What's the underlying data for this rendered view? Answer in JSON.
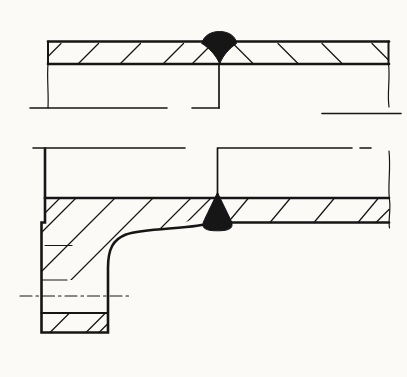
{
  "canvas": {
    "width": 407,
    "height": 377,
    "background": "#fbfaf7",
    "ink": "#161616"
  },
  "drawing": {
    "clips": [
      {
        "id": "clip-flange-hub",
        "d": "M45,198 L213,198 L213,201 C205,210 196,218.5 185,222.5 C165,229.5 141,230 126,234.5 C113,239.5 108,249 108,268 L108,280 L41.5,280 L41.5,222.5 L45,222.5 Z"
      }
    ],
    "groups": [
      {
        "name": "top-pipe-outer-surface-line",
        "stroke": 2.6,
        "paths": [
          "M48,41.5 L389,41.5"
        ]
      },
      {
        "name": "top-pipe-inner-surface-line",
        "stroke": 2.6,
        "paths": [
          "M48,64 L389,64"
        ]
      },
      {
        "name": "top-pipe-left-end-edge",
        "stroke": 2.0,
        "paths": [
          "M48,41.5 L48,64"
        ]
      },
      {
        "name": "top-pipe-left-break-edge",
        "stroke": 1.2,
        "paths": [
          "M48,64 C46.8,78 48.8,94 48,108"
        ]
      },
      {
        "name": "top-pipe-right-end-edge",
        "stroke": 2.0,
        "paths": [
          "M388.5,41.5 L388.5,64"
        ]
      },
      {
        "name": "top-pipe-right-break-edge",
        "stroke": 1.2,
        "paths": [
          "M388.5,64 C390.4,78 387,93 389,107"
        ]
      },
      {
        "name": "top-joint-root-line",
        "stroke": 1.7,
        "paths": [
          "M219,64 L219,108"
        ]
      },
      {
        "name": "top-pipe-bore-lines",
        "stroke": 1.6,
        "paths": [
          "M30,108 L167,108",
          "M192,108 L219,108",
          "M322,113.5 L401,113.5"
        ]
      },
      {
        "name": "top-pipe-hatching-left-part",
        "stroke": 1.25,
        "paths": [
          "M48,56.5 L61,43.5",
          "M78,64 L98.5,43.5",
          "M120,64 L140.5,43.5",
          "M163,64 L183.5,43.5",
          "M192,64 L212,44"
        ]
      },
      {
        "name": "top-pipe-hatching-right-part",
        "stroke": 1.25,
        "paths": [
          "M233,43.5 L253.5,64",
          "M278,43.5 L298.5,64",
          "M322,43.5 L342.5,64",
          "M372,43.5 L388.5,60"
        ]
      },
      {
        "name": "top-weld-bead",
        "stroke": 1.0,
        "fill": true,
        "paths": [
          "M202,43.5 C203,36.5 210,31.5 219.5,31.5 C229,31.5 236,36.5 236.5,43.5 C229.5,48.5 223,55 219.7,64 C216,55 209.5,48.5 202,43.5 Z"
        ]
      },
      {
        "name": "bottom-pipe-outer-surface-lines",
        "stroke": 1.6,
        "paths": [
          "M33,148 L185,148",
          "M218,148 L352,148",
          "M360,148 L371,148"
        ]
      },
      {
        "name": "flange-front-face-edge",
        "stroke": 2.6,
        "paths": [
          "M45,148.5 L45,198"
        ]
      },
      {
        "name": "bottom-joint-root-line",
        "stroke": 1.7,
        "paths": [
          "M217.5,148 L217.5,194"
        ]
      },
      {
        "name": "bottom-pipe-right-break-edge",
        "stroke": 1.2,
        "paths": [
          "M389,151 C391,170 387.5,185 389.5,200",
          "M389.5,200 C391,210 388,220 389.5,228"
        ]
      },
      {
        "name": "bottom-pipe-wall-top-line",
        "stroke": 2.6,
        "paths": [
          "M45,198 L389,198"
        ]
      },
      {
        "name": "bottom-pipe-wall-bottom-line",
        "stroke": 2.6,
        "paths": [
          "M214,222.5 L389,222.5"
        ]
      },
      {
        "name": "flange-outline",
        "stroke": 2.6,
        "paths": [
          "M45,198 L45,222.5 L41.5,222.5 L41.5,332.5 L108,332.5 L108,268 C108,249 113,239.5 126,234.5 C142,229 176,229 197,225.8 C204.5,224.6 210.5,223.6 214,222.5"
        ]
      },
      {
        "name": "flange-bolt-hole-bottom-edge",
        "stroke": 2.0,
        "paths": [
          "M41.5,313 L108,313"
        ]
      },
      {
        "name": "flange-bolt-hole-top-edge",
        "stroke": 1.1,
        "paths": [
          "M42,280 L67,280"
        ]
      },
      {
        "name": "flange-face-detail-line",
        "stroke": 1.1,
        "paths": [
          "M45,245.5 L72,245.5"
        ]
      },
      {
        "name": "bolt-hole-centerline",
        "stroke": 1.1,
        "dash": "12 4 2.5 4",
        "paths": [
          "M20,296 L132,296"
        ]
      },
      {
        "name": "flange-hub-hatching",
        "stroke": 1.25,
        "clip": "clip-flange-hub",
        "paths": [
          "M60,198 L45,213",
          "M76,198 L41.5,232.5",
          "M115,198 L41.5,271.5",
          "M153,198 L68,283",
          "M191,198 L106,283",
          "M211,198 L126,283"
        ]
      },
      {
        "name": "flange-foot-hatching",
        "stroke": 1.25,
        "paths": [
          "M50,332.5 L69.5,313",
          "M86,332.5 L105.5,313",
          "M99,332.5 L108,323.5"
        ]
      },
      {
        "name": "bottom-pipe-hatching-right-part",
        "stroke": 1.25,
        "paths": [
          "M228,222.5 L248.5,198",
          "M270,222.5 L290.5,198",
          "M314,222.5 L334.5,198",
          "M358,222.5 L378.5,198",
          "M376,222.5 L389,209.5"
        ]
      },
      {
        "name": "bottom-weld-bead",
        "stroke": 1.0,
        "fill": true,
        "paths": [
          "M217.5,192.5 C214,200 209,210 204.5,219.5 C200.5,227.5 204,230.8 217.5,230.8 C231,230.8 234.5,227.5 230.5,219.5 C226,210 221,200 217.5,192.5 Z"
        ]
      }
    ]
  }
}
